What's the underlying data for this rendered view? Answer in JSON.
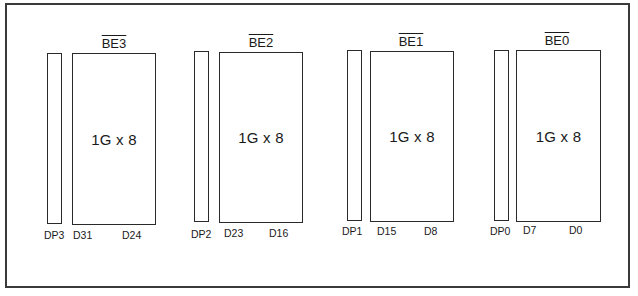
{
  "diagram": {
    "type": "memory-bank-layout",
    "banks": [
      {
        "enable_label": "BE3",
        "enable_active_low": true,
        "chip_label": "1G x 8",
        "parity_label": "DP3",
        "data_high": "D31",
        "data_low": "D24"
      },
      {
        "enable_label": "BE2",
        "enable_active_low": true,
        "chip_label": "1G x 8",
        "parity_label": "DP2",
        "data_high": "D23",
        "data_low": "D16"
      },
      {
        "enable_label": "BE1",
        "enable_active_low": true,
        "chip_label": "1G x 8",
        "parity_label": "DP1",
        "data_high": "D15",
        "data_low": "D8"
      },
      {
        "enable_label": "BE0",
        "enable_active_low": true,
        "chip_label": "1G x 8",
        "parity_label": "DP0",
        "data_high": "D7",
        "data_low": "D0"
      }
    ]
  }
}
